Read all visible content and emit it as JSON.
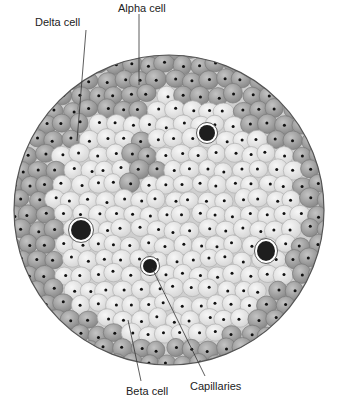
{
  "diagram": {
    "labels": [
      {
        "id": "delta",
        "text": "Delta cell",
        "x": 35,
        "y": 16,
        "line": [
          [
            86,
            30
          ],
          [
            77,
            141
          ]
        ]
      },
      {
        "id": "alpha",
        "text": "Alpha cell",
        "x": 118,
        "y": 2,
        "line": [
          [
            139,
            14
          ],
          [
            139,
            85
          ]
        ]
      },
      {
        "id": "beta",
        "text": "Beta cell",
        "x": 126,
        "y": 385,
        "line": [
          [
            128,
            320
          ],
          [
            141,
            381
          ]
        ]
      },
      {
        "id": "capillaries",
        "text": "Capillaries",
        "x": 190,
        "y": 380,
        "line": [
          [
            152,
            268
          ],
          [
            205,
            376
          ]
        ]
      }
    ],
    "islet": {
      "cx": 169,
      "cy": 210,
      "r": 155
    },
    "capillaries": [
      {
        "cx": 207,
        "cy": 133,
        "rx": 8,
        "ry": 8
      },
      {
        "cx": 81,
        "cy": 230,
        "rx": 10,
        "ry": 10
      },
      {
        "cx": 266,
        "cy": 251,
        "rx": 9,
        "ry": 10
      },
      {
        "cx": 150,
        "cy": 266,
        "rx": 7,
        "ry": 7
      }
    ],
    "colors": {
      "outline": "#555555",
      "beta_cell_fill": "#e6e6e6",
      "beta_cell_stroke": "#b0b0b0",
      "peripheral_cell_fill": "#a6a6a6",
      "peripheral_cell_stroke": "#7a7a7a",
      "nucleus": "#111111",
      "capillary_fill": "#1e1e1e",
      "capillary_ring": "#ffffff",
      "label_text": "#222222",
      "leader_line": "#333333"
    }
  }
}
